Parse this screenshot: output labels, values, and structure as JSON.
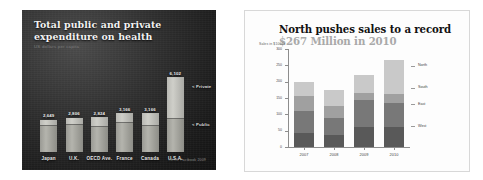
{
  "left_slide": {
    "title": "Total public and private expenditure on health",
    "subtitle": "US dollars per capita",
    "source": "OECD Factbook 2009",
    "annotations": {
      "private": "< Private",
      "public": "< Public"
    },
    "background_color": "#242424",
    "bar_color": "#c2c2bc"
  },
  "right_slide": {
    "title_main": "North pushes sales to a record",
    "title_highlight": "$267 Million in 2010",
    "title_highlight_color": "#a9a9a9",
    "axis_title": "Sales in $1000s",
    "background_color": "#fdfdfd"
  },
  "chart_data": [
    {
      "type": "bar",
      "title": "Total public and private expenditure on health",
      "subtitle": "US dollars per capita",
      "xlabel": "",
      "ylabel": "US dollars per capita",
      "ylim": [
        0,
        8000
      ],
      "grid": false,
      "legend_position": "right-annotations",
      "categories": [
        "Japan",
        "U.K.",
        "OECD Ave.",
        "France",
        "Canada",
        "U.S.A."
      ],
      "value_labels": [
        "2,649",
        "2,806",
        "2,824",
        "3,166",
        "3,166",
        "6,102"
      ],
      "values": [
        2649,
        2806,
        2824,
        3166,
        3166,
        6102
      ],
      "series": [
        {
          "name": "Public",
          "values": [
            2200,
            2230,
            2080,
            2450,
            2200,
            2750
          ]
        },
        {
          "name": "Private",
          "values": [
            449,
            576,
            744,
            716,
            966,
            3352
          ]
        }
      ],
      "source": "OECD Factbook 2009"
    },
    {
      "type": "bar",
      "title": "North pushes sales to a record $267 Million in 2010",
      "xlabel": "",
      "ylabel": "Sales in $1000s",
      "ylim": [
        0,
        300
      ],
      "yticks": [
        0,
        50,
        100,
        150,
        200,
        250,
        300
      ],
      "ytick_labels": [
        "0",
        "50",
        "100",
        "150",
        "200",
        "250",
        "300"
      ],
      "grid": false,
      "legend_position": "right",
      "stacked": true,
      "categories": [
        "2007",
        "2008",
        "2009",
        "2010"
      ],
      "series": [
        {
          "name": "West",
          "values": [
            42,
            37,
            60,
            60
          ],
          "color": "#595959"
        },
        {
          "name": "East",
          "values": [
            69,
            53,
            84,
            75
          ],
          "color": "#787878"
        },
        {
          "name": "South",
          "values": [
            44,
            35,
            20,
            28
          ],
          "color": "#a0a0a0"
        },
        {
          "name": "North",
          "values": [
            45,
            51,
            56,
            104
          ],
          "color": "#c9c9c9"
        }
      ],
      "totals": [
        200,
        176,
        220,
        267
      ]
    }
  ]
}
